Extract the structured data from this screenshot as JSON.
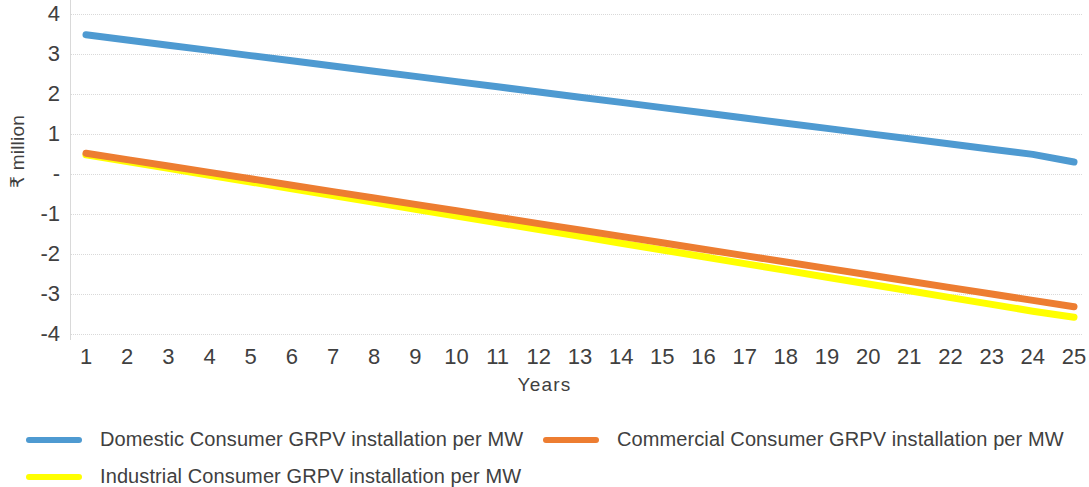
{
  "axes": {
    "y_title": "₹ million",
    "x_title": "Years",
    "y_ticks": [
      "4",
      "3",
      "2",
      "1",
      "-",
      "-1",
      "-2",
      "-3",
      "-4"
    ],
    "y_tick_values": [
      4,
      3,
      2,
      1,
      0,
      -1,
      -2,
      -3,
      -4
    ],
    "x_ticks": [
      "1",
      "2",
      "3",
      "4",
      "5",
      "6",
      "7",
      "8",
      "9",
      "10",
      "11",
      "12",
      "13",
      "14",
      "15",
      "16",
      "17",
      "18",
      "19",
      "20",
      "21",
      "22",
      "23",
      "24",
      "25"
    ]
  },
  "legend": {
    "items": [
      {
        "label": "Domestic Consumer GRPV installation per MW",
        "color": "#4E9AD1"
      },
      {
        "label": "Commercial Consumer GRPV installation per MW",
        "color": "#ED7D31"
      },
      {
        "label": "Industrial Consumer GRPV installation per MW",
        "color": "#FFFF00"
      }
    ]
  },
  "chart_data": {
    "type": "line",
    "title": "",
    "subtitle": "",
    "xlabel": "Years",
    "ylabel": "₹ million",
    "xlim": [
      1,
      25
    ],
    "ylim": [
      -4,
      4
    ],
    "grid": true,
    "legend_position": "bottom",
    "x": [
      1,
      2,
      3,
      4,
      5,
      6,
      7,
      8,
      9,
      10,
      11,
      12,
      13,
      14,
      15,
      16,
      17,
      18,
      19,
      20,
      21,
      22,
      23,
      24,
      25
    ],
    "series": [
      {
        "name": "Domestic Consumer GRPV installation per MW",
        "color": "#4E9AD1",
        "values": [
          3.48,
          3.35,
          3.22,
          3.09,
          2.96,
          2.83,
          2.7,
          2.57,
          2.44,
          2.31,
          2.18,
          2.05,
          1.92,
          1.79,
          1.66,
          1.53,
          1.4,
          1.27,
          1.14,
          1.01,
          0.88,
          0.75,
          0.62,
          0.49,
          0.3
        ]
      },
      {
        "name": "Commercial Consumer GRPV installation per MW",
        "color": "#ED7D31",
        "values": [
          0.52,
          0.36,
          0.2,
          0.04,
          -0.12,
          -0.28,
          -0.44,
          -0.6,
          -0.76,
          -0.92,
          -1.08,
          -1.24,
          -1.4,
          -1.56,
          -1.72,
          -1.88,
          -2.04,
          -2.2,
          -2.36,
          -2.52,
          -2.68,
          -2.84,
          -3.0,
          -3.16,
          -3.32
        ]
      },
      {
        "name": "Industrial Consumer GRPV installation per MW",
        "color": "#FFFF00",
        "values": [
          0.48,
          0.31,
          0.14,
          -0.03,
          -0.2,
          -0.37,
          -0.54,
          -0.71,
          -0.88,
          -1.05,
          -1.22,
          -1.39,
          -1.56,
          -1.73,
          -1.9,
          -2.07,
          -2.24,
          -2.41,
          -2.58,
          -2.75,
          -2.92,
          -3.09,
          -3.26,
          -3.43,
          -3.58
        ]
      }
    ]
  }
}
